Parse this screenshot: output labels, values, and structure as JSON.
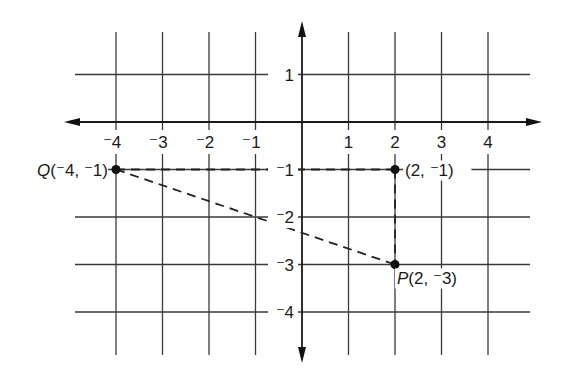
{
  "diagram": {
    "type": "coordinate-grid",
    "colors": {
      "background": "#ffffff",
      "grid": "#3a3a3a",
      "axis": "#1a1a1a",
      "ink": "#111111"
    },
    "x_axis": {
      "range": [
        -4,
        4
      ],
      "tick_labels": [
        {
          "value": -4,
          "label": "⁻4"
        },
        {
          "value": -3,
          "label": "⁻3"
        },
        {
          "value": -2,
          "label": "⁻2"
        },
        {
          "value": -1,
          "label": "⁻1"
        },
        {
          "value": 1,
          "label": "1"
        },
        {
          "value": 2,
          "label": "2"
        },
        {
          "value": 3,
          "label": "3"
        },
        {
          "value": 4,
          "label": "4"
        }
      ]
    },
    "y_axis": {
      "range": [
        -4,
        1
      ],
      "tick_labels": [
        {
          "value": 1,
          "label": "1"
        },
        {
          "value": -1,
          "label": "⁻1"
        },
        {
          "value": -2,
          "label": "⁻2"
        },
        {
          "value": -3,
          "label": "⁻3"
        },
        {
          "value": -4,
          "label": "⁻4"
        }
      ]
    },
    "points": [
      {
        "id": "Q",
        "x": -4,
        "y": -1,
        "label": "Q(⁻4, ⁻1)",
        "label_side": "left"
      },
      {
        "id": "R",
        "x": 2,
        "y": -1,
        "label": "(2, ⁻1)",
        "label_side": "right"
      },
      {
        "id": "P",
        "x": 2,
        "y": -3,
        "label": "P(2, ⁻3)",
        "label_side": "below-right"
      }
    ],
    "segments": [
      {
        "from": "Q",
        "to": "R",
        "style": "dashed"
      },
      {
        "from": "R",
        "to": "P",
        "style": "dashed"
      },
      {
        "from": "Q",
        "to": "P",
        "style": "dashed"
      }
    ]
  }
}
